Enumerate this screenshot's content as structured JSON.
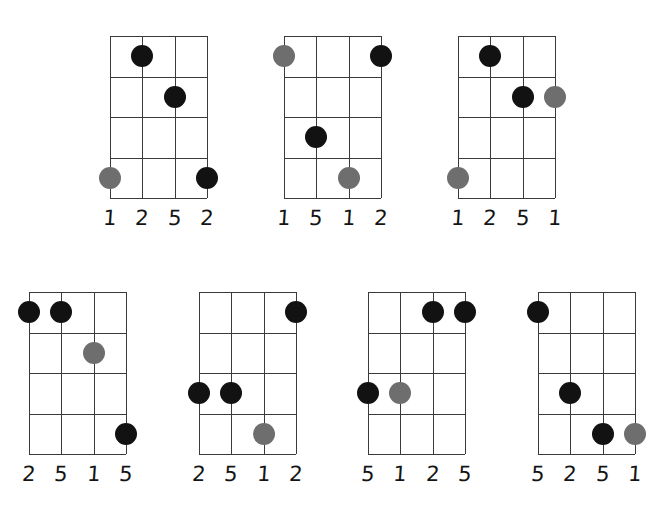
{
  "page": {
    "background_color": "#ffffff",
    "grid_color": "#3a3a3a",
    "dot_black_color": "#121212",
    "dot_gray_color": "#6e6e6e",
    "strings": 4,
    "frets": 4
  },
  "diagrams": [
    {
      "id": "diagram-1",
      "row": 1,
      "col": 1,
      "x": 110,
      "y": 36,
      "labels": [
        "1",
        "2",
        "5",
        "2"
      ],
      "dots": [
        {
          "string": 2,
          "fret": 1,
          "color": "black"
        },
        {
          "string": 3,
          "fret": 2,
          "color": "black"
        },
        {
          "string": 1,
          "fret": 4,
          "color": "gray"
        },
        {
          "string": 4,
          "fret": 4,
          "color": "black"
        }
      ]
    },
    {
      "id": "diagram-2",
      "row": 1,
      "col": 2,
      "x": 284,
      "y": 36,
      "labels": [
        "1",
        "5",
        "1",
        "2"
      ],
      "dots": [
        {
          "string": 1,
          "fret": 1,
          "color": "gray"
        },
        {
          "string": 4,
          "fret": 1,
          "color": "black"
        },
        {
          "string": 2,
          "fret": 3,
          "color": "black"
        },
        {
          "string": 3,
          "fret": 4,
          "color": "gray"
        }
      ]
    },
    {
      "id": "diagram-3",
      "row": 1,
      "col": 3,
      "x": 458,
      "y": 36,
      "labels": [
        "1",
        "2",
        "5",
        "1"
      ],
      "dots": [
        {
          "string": 2,
          "fret": 1,
          "color": "black"
        },
        {
          "string": 3,
          "fret": 2,
          "color": "black"
        },
        {
          "string": 4,
          "fret": 2,
          "color": "gray"
        },
        {
          "string": 1,
          "fret": 4,
          "color": "gray"
        }
      ]
    },
    {
      "id": "diagram-4",
      "row": 2,
      "col": 1,
      "x": 29,
      "y": 292,
      "labels": [
        "2",
        "5",
        "1",
        "5"
      ],
      "dots": [
        {
          "string": 1,
          "fret": 1,
          "color": "black"
        },
        {
          "string": 2,
          "fret": 1,
          "color": "black"
        },
        {
          "string": 3,
          "fret": 2,
          "color": "gray"
        },
        {
          "string": 4,
          "fret": 4,
          "color": "black"
        }
      ]
    },
    {
      "id": "diagram-5",
      "row": 2,
      "col": 2,
      "x": 199,
      "y": 292,
      "labels": [
        "2",
        "5",
        "1",
        "2"
      ],
      "dots": [
        {
          "string": 4,
          "fret": 1,
          "color": "black"
        },
        {
          "string": 1,
          "fret": 3,
          "color": "black"
        },
        {
          "string": 2,
          "fret": 3,
          "color": "black"
        },
        {
          "string": 3,
          "fret": 4,
          "color": "gray"
        }
      ]
    },
    {
      "id": "diagram-6",
      "row": 2,
      "col": 3,
      "x": 368,
      "y": 292,
      "labels": [
        "5",
        "1",
        "2",
        "5"
      ],
      "dots": [
        {
          "string": 3,
          "fret": 1,
          "color": "black"
        },
        {
          "string": 4,
          "fret": 1,
          "color": "black"
        },
        {
          "string": 1,
          "fret": 3,
          "color": "black"
        },
        {
          "string": 2,
          "fret": 3,
          "color": "gray"
        }
      ]
    },
    {
      "id": "diagram-7",
      "row": 2,
      "col": 4,
      "x": 538,
      "y": 292,
      "labels": [
        "5",
        "2",
        "5",
        "1"
      ],
      "dots": [
        {
          "string": 1,
          "fret": 1,
          "color": "black"
        },
        {
          "string": 2,
          "fret": 3,
          "color": "black"
        },
        {
          "string": 3,
          "fret": 4,
          "color": "black"
        },
        {
          "string": 4,
          "fret": 4,
          "color": "gray"
        }
      ]
    }
  ]
}
